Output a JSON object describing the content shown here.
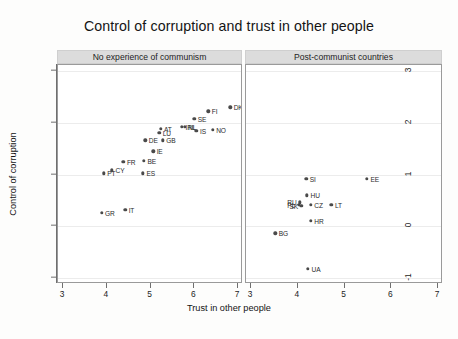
{
  "chart_data": {
    "type": "scatter",
    "title": "Control of corruption and trust in other people",
    "xlabel": "Trust in other people",
    "ylabel": "Control of corruption",
    "xlim": [
      3,
      7
    ],
    "ylim": [
      -1,
      3
    ],
    "xticks": [
      3,
      4,
      5,
      6,
      7
    ],
    "yticks": [
      3,
      2,
      1,
      0,
      -1
    ],
    "grid": "horizontal",
    "legend": "none",
    "panels": [
      {
        "label": "No experience of communism",
        "points": [
          {
            "name": "GR",
            "x": 3.88,
            "y": 0.26,
            "label_pos": "right"
          },
          {
            "name": "PT",
            "x": 3.93,
            "y": 1.02,
            "label_pos": "right"
          },
          {
            "name": "CY",
            "x": 4.12,
            "y": 1.08,
            "label_pos": "right"
          },
          {
            "name": "FR",
            "x": 4.38,
            "y": 1.25,
            "label_pos": "right"
          },
          {
            "name": "IT",
            "x": 4.42,
            "y": 0.32,
            "label_pos": "right"
          },
          {
            "name": "ES",
            "x": 4.83,
            "y": 1.02,
            "label_pos": "right"
          },
          {
            "name": "BE",
            "x": 4.85,
            "y": 1.27,
            "label_pos": "right"
          },
          {
            "name": "DE",
            "x": 4.88,
            "y": 1.66,
            "label_pos": "right"
          },
          {
            "name": "IE",
            "x": 5.06,
            "y": 1.45,
            "label_pos": "right"
          },
          {
            "name": "AT",
            "x": 5.23,
            "y": 1.88,
            "label_pos": "right"
          },
          {
            "name": "LU",
            "x": 5.2,
            "y": 1.8,
            "label_pos": "right"
          },
          {
            "name": "GB",
            "x": 5.28,
            "y": 1.66,
            "label_pos": "right"
          },
          {
            "name": "NL",
            "x": 5.78,
            "y": 1.92,
            "label_pos": "right"
          },
          {
            "name": "IRL",
            "x": 5.72,
            "y": 1.92,
            "label_pos": "right"
          },
          {
            "name": "SE",
            "x": 6.0,
            "y": 2.08,
            "label_pos": "right"
          },
          {
            "name": "IS",
            "x": 6.05,
            "y": 1.84,
            "label_pos": "right"
          },
          {
            "name": "FI",
            "x": 6.32,
            "y": 2.22,
            "label_pos": "right"
          },
          {
            "name": "NO",
            "x": 6.42,
            "y": 1.86,
            "label_pos": "right"
          },
          {
            "name": "DK",
            "x": 6.82,
            "y": 2.3,
            "label_pos": "right"
          }
        ]
      },
      {
        "label": "Post-communist countries",
        "points": [
          {
            "name": "BG",
            "x": 3.52,
            "y": -0.14,
            "label_pos": "right"
          },
          {
            "name": "PL",
            "x": 4.02,
            "y": 0.42,
            "label_pos": "left"
          },
          {
            "name": "SK",
            "x": 4.08,
            "y": 0.4,
            "label_pos": "left"
          },
          {
            "name": "RU",
            "x": 4.05,
            "y": 0.46,
            "label_pos": "left"
          },
          {
            "name": "CZ",
            "x": 4.28,
            "y": 0.42,
            "label_pos": "right"
          },
          {
            "name": "HU",
            "x": 4.2,
            "y": 0.6,
            "label_pos": "right"
          },
          {
            "name": "SI",
            "x": 4.18,
            "y": 0.92,
            "label_pos": "right"
          },
          {
            "name": "HR",
            "x": 4.28,
            "y": 0.1,
            "label_pos": "right"
          },
          {
            "name": "UA",
            "x": 4.22,
            "y": -0.82,
            "label_pos": "right"
          },
          {
            "name": "LT",
            "x": 4.72,
            "y": 0.42,
            "label_pos": "right"
          },
          {
            "name": "EE",
            "x": 5.48,
            "y": 0.92,
            "label_pos": "right"
          }
        ]
      }
    ]
  }
}
